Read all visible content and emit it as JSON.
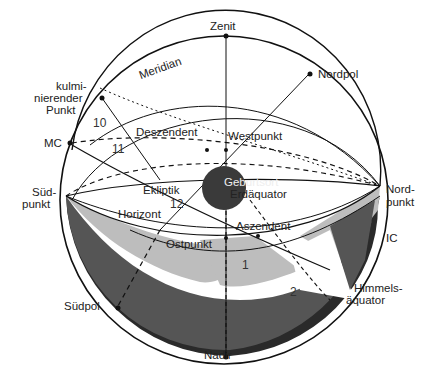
{
  "diagram": {
    "labels": {
      "zenit": "Zenit",
      "nordpol": "Nordpol",
      "meridian": "Meridian",
      "kulminierender_punkt_1": "kulmi-",
      "kulminierender_punkt_2": "nierender",
      "kulminierender_punkt_3": "Punkt",
      "mc": "MC",
      "deszendent": "Deszendent",
      "westpunkt": "Westpunkt",
      "suedpunkt_1": "Süd-",
      "suedpunkt_2": "punkt",
      "nordpunkt_1": "Nord-",
      "nordpunkt_2": "punkt",
      "ekliptik": "Ekliptik",
      "geburtsort": "Geburtsort",
      "erdaequator": "Erdäquator",
      "horizont": "Horizont",
      "aszendent": "Aszendent",
      "ostpunkt": "Ostpunkt",
      "ic": "IC",
      "himmelsaequator_1": "Himmels-",
      "himmelsaequator_2": "äquator",
      "suedpol": "Südpol",
      "nadir": "Nadir"
    },
    "house_numbers": {
      "h10": "10",
      "h11": "11",
      "h12": "12",
      "h1": "1",
      "h2": "2"
    },
    "colors": {
      "line": "#111111",
      "light_gray": "#bdbdbd",
      "mid_gray": "#555555",
      "dark_gray": "#2a2a2a",
      "earth": "#3a3a3a"
    }
  }
}
